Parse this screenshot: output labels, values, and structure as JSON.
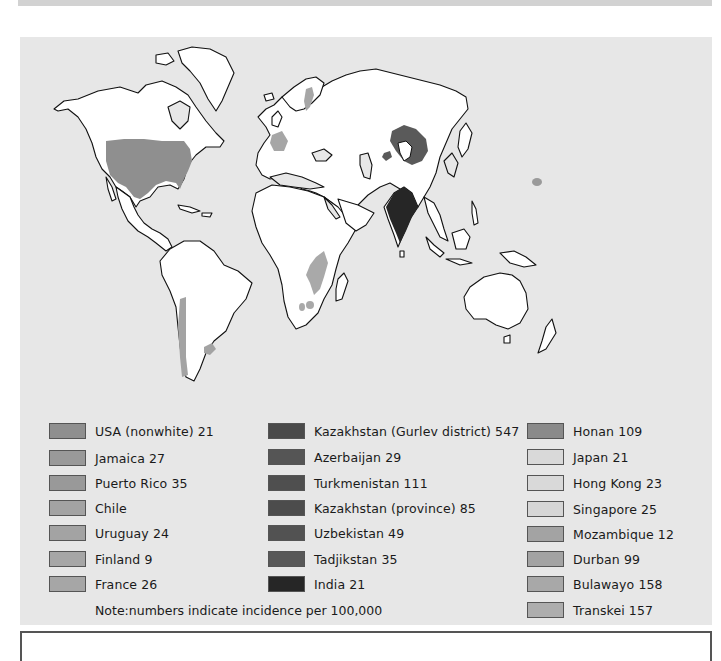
{
  "map": {
    "title": "World incidence of esophageal cancer",
    "colors": {
      "ocean": "#e7e7e7",
      "land": "#ffffff",
      "outline": "#111111",
      "usa": "#8f8f8f",
      "light_gray": "#a9a9a9",
      "central_asia": "#5a5a5a",
      "india": "#262626",
      "honan": "#9a9a9a"
    },
    "highlighted_regions": [
      "USA",
      "France",
      "Finland",
      "Chile",
      "Uruguay",
      "Kazakhstan/Caspian region",
      "India",
      "Honan (China)",
      "Mozambique",
      "South Africa (Durban/Transkei)"
    ]
  },
  "legend": {
    "columns": [
      {
        "items": [
          {
            "label": "USA (nonwhite) 21",
            "color": "#8f8f8f"
          },
          {
            "label": "Jamaica 27",
            "color": "#999999"
          },
          {
            "label": "Puerto Rico 35",
            "color": "#999999"
          },
          {
            "label": "Chile",
            "color": "#a3a3a3"
          },
          {
            "label": "Uruguay 24",
            "color": "#a3a3a3"
          },
          {
            "label": "Finland 9",
            "color": "#a6a6a6"
          },
          {
            "label": "France 26",
            "color": "#a6a6a6"
          }
        ]
      },
      {
        "items": [
          {
            "label": "Kazakhstan (Gurlev district) 547",
            "color": "#4a4a4a"
          },
          {
            "label": "Azerbaijan 29",
            "color": "#555555"
          },
          {
            "label": "Turkmenistan 111",
            "color": "#4f4f4f"
          },
          {
            "label": "Kazakhstan (province) 85",
            "color": "#4c4c4c"
          },
          {
            "label": "Uzbekistan 49",
            "color": "#525252"
          },
          {
            "label": "Tadjikstan 35",
            "color": "#585858"
          },
          {
            "label": "India 21",
            "color": "#262626"
          }
        ]
      },
      {
        "items": [
          {
            "label": "Honan 109",
            "color": "#8a8a8a"
          },
          {
            "label": "Japan 21",
            "color": "#d9d9d9"
          },
          {
            "label": "Hong Kong 23",
            "color": "#d9d9d9"
          },
          {
            "label": "Singapore 25",
            "color": "#d6d6d6"
          },
          {
            "label": "Mozambique 12",
            "color": "#a3a3a3"
          },
          {
            "label": "Durban 99",
            "color": "#a3a3a3"
          },
          {
            "label": "Bulawayo 158",
            "color": "#a8a8a8"
          },
          {
            "label": "Transkei 157",
            "color": "#adadad"
          }
        ]
      }
    ],
    "note": "Note:numbers indicate incidence per 100,000"
  }
}
